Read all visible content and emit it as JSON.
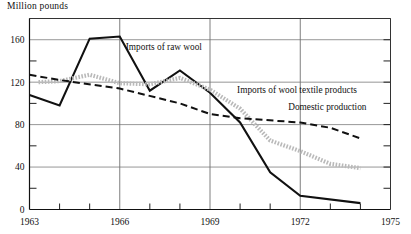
{
  "chart_data": {
    "type": "line",
    "title": "",
    "ylabel": "Million pounds",
    "xlabel": "",
    "xlim": [
      1963,
      1975
    ],
    "ylim": [
      0,
      180
    ],
    "grid": true,
    "legend_position": "inline-annotations",
    "x_ticks_major": [
      "1963",
      "1966",
      "1969",
      "1972",
      "1975"
    ],
    "x_ticks_major_values": [
      1963,
      1966,
      1969,
      1972,
      1975
    ],
    "x_ticks_minor_values": [
      1964,
      1965,
      1967,
      1968,
      1970,
      1971,
      1973,
      1974
    ],
    "y_ticks_major": [
      "0",
      "40",
      "80",
      "120",
      "160"
    ],
    "y_ticks_major_values": [
      0,
      40,
      80,
      120,
      160
    ],
    "y_ticks_minor_values": [
      20,
      60,
      100,
      140,
      180
    ],
    "series": [
      {
        "name": "Imports of raw wool",
        "style": "solid",
        "color": "#111111",
        "x": [
          1963,
          1964,
          1965,
          1966,
          1967,
          1968,
          1969,
          1970,
          1971,
          1972,
          1974
        ],
        "values": [
          108,
          98,
          161,
          163,
          112,
          131,
          110,
          82,
          35,
          13,
          6
        ]
      },
      {
        "name": "Imports of wool textile products",
        "style": "dotted-thick",
        "color": "#b9b9b9",
        "x": [
          1963.3,
          1964,
          1965,
          1966,
          1967,
          1968,
          1969,
          1970,
          1971,
          1972,
          1973,
          1974
        ],
        "values": [
          120,
          121,
          127,
          119,
          118,
          124,
          113,
          95,
          65,
          55,
          43,
          39
        ]
      },
      {
        "name": "Domestic production",
        "style": "dashed",
        "color": "#111111",
        "x": [
          1963,
          1964,
          1966,
          1968,
          1969,
          1970,
          1972,
          1973,
          1974
        ],
        "values": [
          127,
          122,
          114,
          100,
          90,
          86,
          82,
          77,
          67
        ]
      }
    ],
    "annotations": [
      {
        "text": "Imports of raw wool",
        "x": 1966.2,
        "y": 150
      },
      {
        "text": "Imports of wool textile products",
        "x": 1969.9,
        "y": 110
      },
      {
        "text": "Domestic production",
        "x": 1971.6,
        "y": 94
      }
    ]
  },
  "axis_title": {
    "label": "Million pounds"
  }
}
